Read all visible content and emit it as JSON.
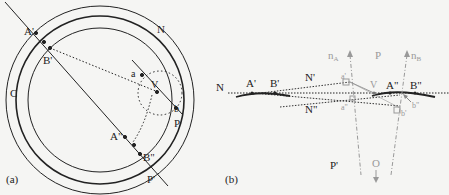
{
  "panel_a": {
    "caption": "(a)",
    "labels": {
      "A_prime": "A'",
      "B_prime": "B'",
      "N": "N",
      "C": "C",
      "a": "a",
      "V": "V",
      "b": "b",
      "P": "P",
      "A_dprime": "A\"",
      "B_dprime": "B\"",
      "P_prime": "P'"
    }
  },
  "panel_b": {
    "caption": "(b)",
    "labels": {
      "N": "N",
      "A_prime": "A'",
      "B_prime": "B'",
      "N_prime": "N'",
      "N_dprime": "N\"",
      "nA": "n",
      "nA_sub": "A",
      "P": "P",
      "nB": "n",
      "nB_sub": "B",
      "a_prime": "a'",
      "a_dprime": "a\"",
      "V": "V",
      "A_dprime": "A\"",
      "B_dprime": "B\"",
      "b_prime": "b'",
      "b_dprime": "b\"",
      "P_prime": "P'",
      "O": "O"
    }
  },
  "colors": {
    "ink": "#222222",
    "faint": "#9a9a9a",
    "background": "#f5f5f3"
  }
}
